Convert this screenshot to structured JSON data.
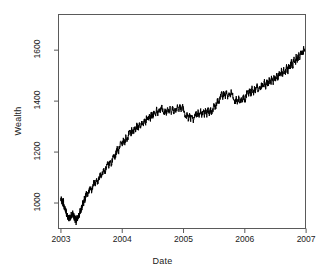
{
  "chart_data": {
    "type": "line",
    "title": "",
    "xlabel": "Date",
    "ylabel": "Wealth",
    "xlim": [
      2002.96,
      2006.99
    ],
    "ylim": [
      900,
      1740
    ],
    "grid": false,
    "legend": null,
    "line_color": "#000000",
    "background": "#ffffff",
    "border_color": "#5a5a5a",
    "xticks": [
      {
        "value": 2003,
        "label": "2003"
      },
      {
        "value": 2004,
        "label": "2004"
      },
      {
        "value": 2005,
        "label": "2005"
      },
      {
        "value": 2006,
        "label": "2006"
      },
      {
        "value": 2007,
        "label": "2007"
      }
    ],
    "yticks": [
      {
        "value": 1000,
        "label": "1000"
      },
      {
        "value": 1200,
        "label": "1200"
      },
      {
        "value": 1400,
        "label": "1400"
      },
      {
        "value": 1600,
        "label": "1600"
      }
    ],
    "series": [
      {
        "name": "Wealth",
        "x": [
          2003.0,
          2003.008,
          2003.016,
          2003.024,
          2003.032,
          2003.04,
          2003.048,
          2003.056,
          2003.064,
          2003.072,
          2003.08,
          2003.088,
          2003.096,
          2003.104,
          2003.112,
          2003.12,
          2003.128,
          2003.136,
          2003.144,
          2003.152,
          2003.16,
          2003.168,
          2003.176,
          2003.184,
          2003.192,
          2003.2,
          2003.208,
          2003.216,
          2003.224,
          2003.232,
          2003.24,
          2003.248,
          2003.256,
          2003.264,
          2003.272,
          2003.28,
          2003.288,
          2003.296,
          2003.304,
          2003.312,
          2003.32,
          2003.328,
          2003.336,
          2003.344,
          2003.352,
          2003.36,
          2003.368,
          2003.376,
          2003.384,
          2003.392,
          2003.4,
          2003.42,
          2003.44,
          2003.46,
          2003.48,
          2003.5,
          2003.52,
          2003.54,
          2003.56,
          2003.58,
          2003.6,
          2003.62,
          2003.64,
          2003.66,
          2003.68,
          2003.7,
          2003.72,
          2003.74,
          2003.76,
          2003.78,
          2003.8,
          2003.82,
          2003.84,
          2003.86,
          2003.88,
          2003.9,
          2003.92,
          2003.94,
          2003.96,
          2003.98,
          2004.0,
          2004.02,
          2004.04,
          2004.06,
          2004.08,
          2004.1,
          2004.12,
          2004.14,
          2004.16,
          2004.18,
          2004.2,
          2004.22,
          2004.24,
          2004.26,
          2004.28,
          2004.3,
          2004.32,
          2004.34,
          2004.36,
          2004.38,
          2004.4,
          2004.42,
          2004.44,
          2004.46,
          2004.48,
          2004.5,
          2004.52,
          2004.54,
          2004.56,
          2004.58,
          2004.6,
          2004.62,
          2004.64,
          2004.66,
          2004.68,
          2004.7,
          2004.72,
          2004.74,
          2004.76,
          2004.78,
          2004.8,
          2004.82,
          2004.84,
          2004.86,
          2004.88,
          2004.9,
          2004.92,
          2004.94,
          2004.96,
          2004.98,
          2005.0,
          2005.02,
          2005.04,
          2005.06,
          2005.08,
          2005.1,
          2005.12,
          2005.14,
          2005.16,
          2005.18,
          2005.2,
          2005.22,
          2005.24,
          2005.26,
          2005.28,
          2005.3,
          2005.32,
          2005.34,
          2005.36,
          2005.38,
          2005.4,
          2005.42,
          2005.44,
          2005.46,
          2005.48,
          2005.5,
          2005.52,
          2005.54,
          2005.56,
          2005.58,
          2005.6,
          2005.62,
          2005.64,
          2005.66,
          2005.68,
          2005.7,
          2005.72,
          2005.74,
          2005.76,
          2005.78,
          2005.8,
          2005.82,
          2005.84,
          2005.86,
          2005.88,
          2005.9,
          2005.92,
          2005.94,
          2005.96,
          2005.98,
          2006.0,
          2006.02,
          2006.04,
          2006.06,
          2006.08,
          2006.1,
          2006.12,
          2006.14,
          2006.16,
          2006.18,
          2006.2,
          2006.22,
          2006.24,
          2006.26,
          2006.28,
          2006.3,
          2006.32,
          2006.34,
          2006.36,
          2006.38,
          2006.4,
          2006.42,
          2006.44,
          2006.46,
          2006.48,
          2006.5,
          2006.52,
          2006.54,
          2006.56,
          2006.58,
          2006.6,
          2006.62,
          2006.64,
          2006.66,
          2006.68,
          2006.7,
          2006.72,
          2006.74,
          2006.76,
          2006.78,
          2006.8,
          2006.82,
          2006.84,
          2006.86,
          2006.88,
          2006.9,
          2006.92,
          2006.94,
          2006.96,
          2006.98
        ],
        "y": [
          1010,
          1022,
          1004,
          1016,
          995,
          1008,
          986,
          974,
          982,
          965,
          972,
          958,
          946,
          955,
          938,
          947,
          932,
          941,
          950,
          936,
          944,
          958,
          945,
          952,
          962,
          948,
          956,
          938,
          948,
          930,
          941,
          922,
          934,
          947,
          935,
          944,
          958,
          946,
          957,
          972,
          960,
          975,
          990,
          978,
          992,
          1006,
          994,
          1008,
          1022,
          1010,
          1025,
          1042,
          1030,
          1048,
          1062,
          1050,
          1068,
          1084,
          1072,
          1090,
          1078,
          1096,
          1112,
          1100,
          1118,
          1135,
          1122,
          1140,
          1158,
          1146,
          1164,
          1152,
          1170,
          1188,
          1176,
          1196,
          1214,
          1202,
          1222,
          1240,
          1228,
          1248,
          1236,
          1258,
          1245,
          1266,
          1284,
          1270,
          1290,
          1276,
          1298,
          1285,
          1306,
          1292,
          1312,
          1298,
          1320,
          1305,
          1328,
          1314,
          1336,
          1322,
          1345,
          1330,
          1352,
          1338,
          1360,
          1346,
          1368,
          1352,
          1375,
          1358,
          1382,
          1366,
          1350,
          1368,
          1352,
          1370,
          1355,
          1372,
          1356,
          1374,
          1358,
          1376,
          1360,
          1378,
          1362,
          1380,
          1364,
          1382,
          1366,
          1350,
          1334,
          1348,
          1330,
          1345,
          1326,
          1342,
          1322,
          1338,
          1355,
          1340,
          1358,
          1342,
          1360,
          1344,
          1362,
          1346,
          1364,
          1348,
          1366,
          1350,
          1368,
          1352,
          1370,
          1388,
          1372,
          1392,
          1408,
          1395,
          1412,
          1430,
          1415,
          1435,
          1418,
          1438,
          1420,
          1440,
          1422,
          1442,
          1425,
          1408,
          1392,
          1410,
          1394,
          1412,
          1396,
          1414,
          1398,
          1418,
          1400,
          1420,
          1440,
          1425,
          1445,
          1428,
          1450,
          1432,
          1455,
          1438,
          1460,
          1442,
          1465,
          1448,
          1470,
          1452,
          1475,
          1458,
          1480,
          1462,
          1486,
          1468,
          1492,
          1475,
          1498,
          1480,
          1505,
          1488,
          1512,
          1495,
          1520,
          1502,
          1528,
          1510,
          1535,
          1518,
          1545,
          1528,
          1555,
          1538,
          1565,
          1548,
          1575,
          1558,
          1585,
          1568,
          1598,
          1580,
          1612,
          1595
        ]
      }
    ],
    "annotations": []
  }
}
